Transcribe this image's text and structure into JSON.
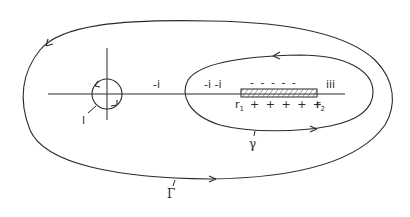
{
  "diagram": {
    "contours": [
      {
        "name": "Gamma",
        "label": "Γ",
        "orientation": "counterclockwise"
      },
      {
        "name": "gamma",
        "label": "γ",
        "orientation": "counterclockwise"
      },
      {
        "name": "small-circle",
        "label": "l",
        "orientation": "counterclockwise"
      }
    ],
    "segment": {
      "start_label": "r",
      "start_sub": "1",
      "end_label": "r",
      "end_sub": "2"
    },
    "labels": {
      "left_of_gamma": "-i",
      "inside_left": "-i -i",
      "above_segment": "- - - - -",
      "below_segment": "+ + + + +",
      "right_of_segment": "iii"
    }
  }
}
